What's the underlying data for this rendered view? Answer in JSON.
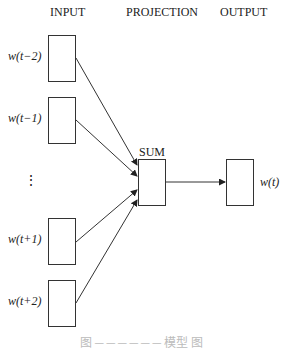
{
  "headers": {
    "input": "INPUT",
    "projection": "PROJECTION",
    "output": "OUTPUT"
  },
  "inputs": [
    {
      "label": "w(t−2)"
    },
    {
      "label": "w(t−1)"
    },
    {
      "label": "w(t+1)"
    },
    {
      "label": "w(t+2)"
    }
  ],
  "ellipsis": "⋮",
  "projection": {
    "label": "SUM"
  },
  "output": {
    "label": "w(t)"
  },
  "caption": "图 ─ ─ ─ ─ ─ ─ 模型 图"
}
